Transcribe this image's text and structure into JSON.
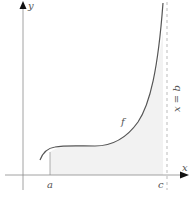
{
  "diagram": {
    "labels": {
      "y_axis": "y",
      "x_axis": "x",
      "point_a": "a",
      "point_c": "c",
      "function": "f",
      "vertical_line": "x = b"
    },
    "colors": {
      "axis": "#666666",
      "curve": "#555555",
      "shade": "#f2f2f2",
      "dashed_line": "#aaaaaa",
      "arrow": "#111111"
    }
  }
}
